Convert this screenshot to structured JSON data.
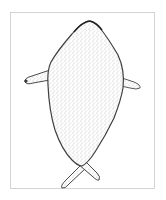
{
  "figure": {
    "colors": {
      "outline": "#3a3a3a",
      "stipple": "#6e6e6e",
      "frame": "#d4d4d4",
      "background": "#ffffff"
    }
  }
}
